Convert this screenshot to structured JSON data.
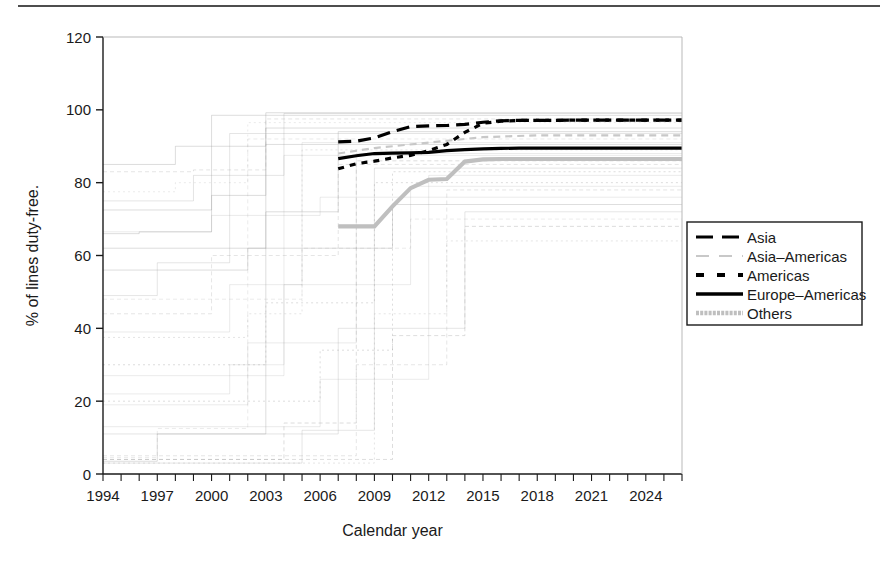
{
  "figure": {
    "top_rule": true,
    "background_color": "#ffffff"
  },
  "chart_data": {
    "type": "line",
    "title": "",
    "xlabel": "Calendar year",
    "ylabel": "% of lines duty-free.",
    "xlim": [
      1994,
      2026
    ],
    "ylim": [
      0,
      120
    ],
    "yticks": [
      0,
      20,
      40,
      60,
      80,
      100,
      120
    ],
    "ytick_labels": [
      "0",
      "20",
      "40",
      "60",
      "80",
      "100",
      "120"
    ],
    "xticks": [
      1994,
      1997,
      2000,
      2003,
      2006,
      2009,
      2012,
      2015,
      2018,
      2021,
      2024
    ],
    "xtick_labels": [
      "1994",
      "1997",
      "2000",
      "2003",
      "2006",
      "2009",
      "2012",
      "2015",
      "2018",
      "2021",
      "2024"
    ],
    "x_minor_tick_step": 1,
    "grid": false,
    "legend_position": "right-outside",
    "series": [
      {
        "name": "Asia",
        "style": "long-dash",
        "color": "#000000",
        "width": 3.2,
        "x": [
          2007,
          2008,
          2009,
          2010,
          2011,
          2012,
          2013,
          2014,
          2015,
          2016,
          2017,
          2018,
          2019,
          2020,
          2021,
          2022,
          2023,
          2024,
          2025,
          2026
        ],
        "y": [
          91.2,
          91.4,
          92.3,
          94.0,
          95.4,
          95.6,
          95.7,
          96.0,
          96.6,
          97.0,
          97.1,
          97.1,
          97.1,
          97.2,
          97.2,
          97.2,
          97.2,
          97.2,
          97.2,
          97.2
        ]
      },
      {
        "name": "Asia–Americas",
        "style": "short-dash",
        "color": "#c8c8c8",
        "width": 2.2,
        "x": [
          2007,
          2009,
          2012,
          2015,
          2018,
          2021,
          2024,
          2026
        ],
        "y": [
          88.0,
          89.5,
          91.0,
          92.5,
          93.0,
          93.0,
          93.0,
          93.0
        ]
      },
      {
        "name": "Americas",
        "style": "dotted-dash",
        "color": "#000000",
        "width": 3.2,
        "x": [
          2007,
          2008,
          2009,
          2010,
          2011,
          2012,
          2013,
          2014,
          2015,
          2016,
          2017,
          2018,
          2019,
          2020,
          2021,
          2022,
          2023,
          2024,
          2025,
          2026
        ],
        "y": [
          83.8,
          85.2,
          85.9,
          86.8,
          87.5,
          88.8,
          90.5,
          93.8,
          96.3,
          96.9,
          97.1,
          97.1,
          97.1,
          97.2,
          97.2,
          97.2,
          97.2,
          97.2,
          97.2,
          97.2
        ]
      },
      {
        "name": "Europe–Americas",
        "style": "solid",
        "color": "#000000",
        "width": 3.2,
        "x": [
          2007,
          2008,
          2009,
          2010,
          2011,
          2012,
          2013,
          2014,
          2015,
          2016,
          2017,
          2018,
          2019,
          2020,
          2021,
          2022,
          2023,
          2024,
          2025,
          2026
        ],
        "y": [
          86.6,
          87.4,
          88.0,
          88.1,
          88.2,
          88.3,
          88.8,
          89.1,
          89.3,
          89.4,
          89.5,
          89.5,
          89.5,
          89.5,
          89.5,
          89.5,
          89.5,
          89.5,
          89.5,
          89.5
        ]
      },
      {
        "name": "Others",
        "style": "solid",
        "color": "#bfbfbf",
        "width": 4.2,
        "x": [
          2007,
          2008,
          2009,
          2010,
          2011,
          2012,
          2013,
          2014,
          2015,
          2016,
          2017,
          2018,
          2019,
          2020,
          2021,
          2022,
          2023,
          2024,
          2025,
          2026
        ],
        "y": [
          68.0,
          68.0,
          68.0,
          73.5,
          78.5,
          80.8,
          81.0,
          85.8,
          86.4,
          86.5,
          86.5,
          86.5,
          86.5,
          86.5,
          86.5,
          86.5,
          86.5,
          86.5,
          86.5,
          86.5
        ]
      }
    ],
    "background_series_note": "Faint light-grey step curves for individual economies behind the highlighted averages",
    "background_series": [
      {
        "x": [
          1994,
          1996,
          1996,
          2000,
          2000,
          2026
        ],
        "y": [
          66.0,
          66.0,
          66.5,
          66.5,
          98.5,
          98.5
        ]
      },
      {
        "x": [
          1994,
          1999,
          1999,
          2003,
          2003,
          2026
        ],
        "y": [
          83.0,
          83.0,
          83.5,
          83.5,
          97.5,
          97.5
        ]
      },
      {
        "x": [
          1994,
          1998,
          1998,
          2002,
          2002,
          2026
        ],
        "y": [
          77.5,
          77.5,
          80.0,
          80.0,
          96.5,
          96.5
        ]
      },
      {
        "x": [
          1994,
          2000,
          2000,
          2003,
          2003,
          2026
        ],
        "y": [
          72.5,
          72.5,
          76.5,
          76.5,
          95.0,
          95.0
        ]
      },
      {
        "x": [
          1994,
          1997,
          1997,
          2001,
          2001,
          2026
        ],
        "y": [
          49.0,
          49.0,
          58.0,
          58.0,
          93.5,
          93.5
        ]
      },
      {
        "x": [
          1994,
          1997,
          1997,
          2002,
          2002,
          2026
        ],
        "y": [
          4.5,
          4.5,
          12.5,
          12.5,
          92.0,
          92.0
        ]
      },
      {
        "x": [
          1994,
          1997,
          1997,
          2003,
          2003,
          2026
        ],
        "y": [
          3.5,
          3.5,
          11.0,
          11.0,
          90.5,
          90.5
        ]
      },
      {
        "x": [
          1994,
          2002,
          2002,
          2005,
          2005,
          2026
        ],
        "y": [
          37.5,
          37.5,
          44.0,
          44.0,
          89.0,
          89.0
        ]
      },
      {
        "x": [
          1994,
          2001,
          2001,
          2004,
          2004,
          2026
        ],
        "y": [
          22.0,
          22.0,
          30.0,
          30.0,
          87.5,
          87.5
        ]
      },
      {
        "x": [
          1994,
          2004,
          2004,
          2008,
          2008,
          2026
        ],
        "y": [
          4.0,
          4.0,
          14.0,
          14.0,
          86.0,
          86.0
        ]
      },
      {
        "x": [
          1994,
          2005,
          2005,
          2009,
          2009,
          2026
        ],
        "y": [
          3.0,
          3.0,
          12.0,
          12.0,
          84.0,
          84.0
        ]
      },
      {
        "x": [
          1994,
          2006,
          2006,
          2012,
          2012,
          2026
        ],
        "y": [
          13.0,
          13.0,
          26.0,
          26.0,
          82.0,
          82.0
        ]
      },
      {
        "x": [
          1994,
          2003,
          2003,
          2009,
          2009,
          2026
        ],
        "y": [
          30.0,
          30.0,
          47.0,
          47.0,
          80.0,
          80.0
        ]
      },
      {
        "x": [
          1994,
          2008,
          2008,
          2013,
          2013,
          2026
        ],
        "y": [
          5.0,
          5.0,
          30.0,
          30.0,
          78.0,
          78.0
        ]
      },
      {
        "x": [
          1994,
          2000,
          2000,
          2006,
          2006,
          2026
        ],
        "y": [
          66.5,
          66.5,
          71.0,
          71.0,
          76.0,
          76.0
        ]
      },
      {
        "x": [
          1994,
          2002,
          2002,
          2010,
          2010,
          2026
        ],
        "y": [
          56.0,
          56.0,
          62.0,
          62.0,
          74.0,
          74.0
        ]
      },
      {
        "x": [
          1994,
          2007,
          2007,
          2014,
          2014,
          2026
        ],
        "y": [
          11.0,
          11.0,
          40.0,
          40.0,
          72.0,
          72.0
        ]
      },
      {
        "x": [
          1994,
          2005,
          2005,
          2011,
          2011,
          2026
        ],
        "y": [
          48.0,
          48.0,
          62.0,
          62.0,
          70.0,
          70.0
        ]
      },
      {
        "x": [
          1994,
          2003,
          2003,
          2007,
          2007,
          2026
        ],
        "y": [
          62.0,
          62.0,
          72.0,
          72.0,
          94.0,
          94.0
        ]
      },
      {
        "x": [
          1994,
          1999,
          1999,
          2004,
          2004,
          2026
        ],
        "y": [
          75.0,
          75.0,
          82.0,
          82.0,
          99.0,
          99.0
        ]
      },
      {
        "x": [
          1994,
          2001,
          2001,
          2005,
          2005,
          2026
        ],
        "y": [
          39.0,
          39.0,
          52.0,
          52.0,
          91.0,
          91.0
        ]
      },
      {
        "x": [
          1994,
          2010,
          2010,
          2014,
          2014,
          2026
        ],
        "y": [
          4.0,
          4.0,
          38.0,
          38.0,
          68.0,
          68.0
        ]
      },
      {
        "x": [
          1994,
          2009,
          2009,
          2013,
          2013,
          2026
        ],
        "y": [
          3.0,
          3.0,
          44.0,
          44.0,
          64.0,
          64.0
        ]
      },
      {
        "x": [
          1994,
          2002,
          2002,
          2008,
          2008,
          2026
        ],
        "y": [
          19.0,
          19.0,
          36.0,
          36.0,
          88.0,
          88.0
        ]
      },
      {
        "x": [
          1994,
          1998,
          1998,
          2003,
          2003,
          2026
        ],
        "y": [
          85.0,
          85.0,
          90.0,
          90.0,
          99.2,
          99.2
        ]
      },
      {
        "x": [
          1994,
          2000,
          2000,
          2007,
          2007,
          2026
        ],
        "y": [
          44.0,
          44.0,
          60.0,
          60.0,
          85.0,
          85.0
        ]
      },
      {
        "x": [
          1994,
          2004,
          2004,
          2011,
          2011,
          2026
        ],
        "y": [
          27.0,
          27.0,
          52.0,
          52.0,
          79.0,
          79.0
        ]
      },
      {
        "x": [
          1994,
          2006,
          2006,
          2010,
          2010,
          2026
        ],
        "y": [
          20.0,
          20.0,
          34.0,
          34.0,
          83.0,
          83.0
        ]
      }
    ]
  },
  "legend": {
    "items": [
      {
        "label": "Asia",
        "style": "long-dash",
        "color": "#000000"
      },
      {
        "label": "Asia–Americas",
        "style": "short-dash",
        "color": "#c8c8c8"
      },
      {
        "label": "Americas",
        "style": "dotted-dash",
        "color": "#000000"
      },
      {
        "label": "Europe–Americas",
        "style": "solid",
        "color": "#000000"
      },
      {
        "label": "Others",
        "style": "solid-thick",
        "color": "#bfbfbf"
      }
    ]
  }
}
